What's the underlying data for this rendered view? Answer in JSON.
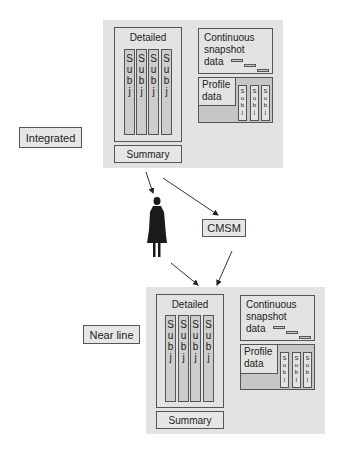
{
  "labels": {
    "integrated": "Integrated",
    "near_line": "Near line",
    "cmsm": "CMSM"
  },
  "top_block": {
    "detailed": "Detailed",
    "subj_columns": [
      "S",
      "u",
      "b",
      "j"
    ],
    "summary": "Summary",
    "continuous": [
      "Continuous",
      "snapshot",
      "data"
    ],
    "profile": [
      "Profile",
      "data"
    ],
    "profile_subj": [
      "S",
      "u",
      "b",
      "j"
    ]
  },
  "bottom_block": {
    "detailed": "Detailed",
    "subj_columns": [
      "S",
      "u",
      "b",
      "j"
    ],
    "summary": "Summary",
    "continuous": [
      "Continuous",
      "snapshot",
      "data"
    ],
    "profile": [
      "Profile",
      "data"
    ],
    "profile_subj": [
      "S",
      "u",
      "b",
      "j"
    ]
  },
  "colors": {
    "panel": "#e3e3e3",
    "column": "#cdcdcd",
    "profile_panel": "#c6c6c6",
    "stroke": "#555555",
    "person": "#1a1a1a"
  }
}
